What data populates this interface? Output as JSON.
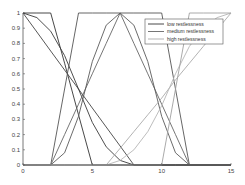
{
  "chart_data": {
    "type": "line",
    "title": "",
    "xlabel": "",
    "ylabel": "",
    "xlim": [
      0,
      15
    ],
    "ylim": [
      0,
      1
    ],
    "xticks": [
      0,
      5,
      10,
      15
    ],
    "yticks": [
      0,
      0.1,
      0.2,
      0.3,
      0.4,
      0.5,
      0.6,
      0.7,
      0.8,
      0.9,
      1
    ],
    "xtick_labels": [
      "0",
      "5",
      "10",
      "15"
    ],
    "ytick_labels": [
      "0",
      "0.1",
      "0.2",
      "0.3",
      "0.4",
      "0.5",
      "0.6",
      "0.7",
      "0.8",
      "0.9",
      "1"
    ],
    "grid": false,
    "legend_position": "upper right",
    "legend": [
      "low restlessness",
      "medium restlessness",
      "high restlessness"
    ],
    "series": [
      {
        "name": "low restlessness",
        "color": "#333333",
        "variant": "trapezoid",
        "x": [
          0,
          1,
          2,
          3,
          4,
          5,
          6,
          7,
          8,
          9,
          10,
          11,
          12,
          13,
          14,
          15
        ],
        "y": [
          1,
          1,
          1,
          0.67,
          0.33,
          0,
          0,
          0,
          0,
          0,
          0,
          0,
          0,
          0,
          0,
          0
        ]
      },
      {
        "name": "low restlessness",
        "color": "#444444",
        "variant": "linear",
        "x": [
          0,
          1,
          2,
          3,
          4,
          5,
          6,
          7,
          8,
          9,
          10,
          11,
          12,
          13,
          14,
          15
        ],
        "y": [
          1,
          0.875,
          0.75,
          0.625,
          0.5,
          0.375,
          0.25,
          0.125,
          0,
          0,
          0,
          0,
          0,
          0,
          0,
          0
        ]
      },
      {
        "name": "low restlessness",
        "color": "#3a3a3a",
        "variant": "curved",
        "x": [
          0,
          1,
          2,
          3,
          4,
          5,
          6,
          7,
          8,
          9,
          10,
          11,
          12,
          13,
          14,
          15
        ],
        "y": [
          1,
          0.97,
          0.88,
          0.72,
          0.5,
          0.28,
          0.12,
          0.03,
          0,
          0,
          0,
          0,
          0,
          0,
          0,
          0
        ]
      },
      {
        "name": "medium restlessness",
        "color": "#555555",
        "variant": "trapezoid",
        "x": [
          0,
          1,
          2,
          3,
          4,
          5,
          6,
          7,
          8,
          9,
          10,
          11,
          12,
          13,
          14,
          15
        ],
        "y": [
          0,
          0,
          0,
          0.5,
          1,
          1,
          1,
          1,
          1,
          1,
          1,
          0.5,
          0,
          0,
          0,
          0
        ]
      },
      {
        "name": "medium restlessness",
        "color": "#666666",
        "variant": "triangle",
        "x": [
          0,
          1,
          2,
          3,
          4,
          5,
          6,
          7,
          8,
          9,
          10,
          11,
          12,
          13,
          14,
          15
        ],
        "y": [
          0,
          0,
          0,
          0.2,
          0.4,
          0.6,
          0.8,
          1,
          0.8,
          0.6,
          0.4,
          0.2,
          0,
          0,
          0,
          0
        ]
      },
      {
        "name": "medium restlessness",
        "color": "#5a5a5a",
        "variant": "curved",
        "x": [
          0,
          1,
          2,
          3,
          4,
          5,
          6,
          7,
          8,
          9,
          10,
          11,
          12,
          13,
          14,
          15
        ],
        "y": [
          0,
          0,
          0,
          0.08,
          0.32,
          0.68,
          0.92,
          1,
          0.92,
          0.68,
          0.32,
          0.08,
          0,
          0,
          0,
          0
        ]
      },
      {
        "name": "high restlessness",
        "color": "#aaaaaa",
        "variant": "linear",
        "x": [
          0,
          1,
          2,
          3,
          4,
          5,
          6,
          7,
          8,
          9,
          10,
          11,
          12,
          13,
          14,
          15
        ],
        "y": [
          0,
          0,
          0,
          0,
          0,
          0,
          0,
          0.11,
          0.22,
          0.33,
          0.44,
          0.56,
          0.67,
          0.78,
          0.89,
          1
        ]
      },
      {
        "name": "high restlessness",
        "color": "#b5b5b5",
        "variant": "curved",
        "x": [
          0,
          1,
          2,
          3,
          4,
          5,
          6,
          7,
          8,
          9,
          10,
          11,
          12,
          13,
          14,
          15
        ],
        "y": [
          0,
          0,
          0,
          0,
          0,
          0,
          0,
          0.03,
          0.1,
          0.22,
          0.39,
          0.6,
          0.78,
          0.9,
          0.97,
          1
        ]
      },
      {
        "name": "high restlessness",
        "color": "#a0a0a0",
        "variant": "trapezoid",
        "x": [
          0,
          1,
          2,
          3,
          4,
          5,
          6,
          7,
          8,
          9,
          10,
          11,
          12,
          13,
          14,
          15
        ],
        "y": [
          0,
          0,
          0,
          0,
          0,
          0,
          0,
          0,
          0,
          0,
          0,
          0.5,
          1,
          1,
          1,
          1
        ]
      }
    ]
  }
}
